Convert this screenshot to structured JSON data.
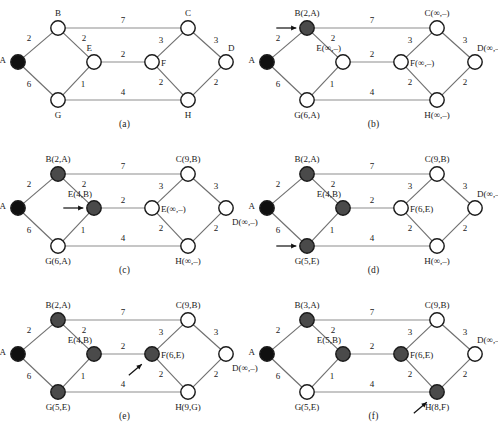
{
  "figure": {
    "caption": "",
    "panel_count": 6
  },
  "graph": {
    "weights": {
      "AB": "2",
      "AG": "6",
      "BE": "2",
      "BC": "7",
      "EF": "2",
      "EG": "1",
      "GH": "4",
      "CF": "3",
      "CD": "3",
      "FH": "2",
      "DH": "2"
    }
  },
  "panels": [
    {
      "id": "a",
      "caption": "(a)",
      "arrow": null,
      "nodes": {
        "A": {
          "label": "A",
          "state": "black",
          "label_pos": "left"
        },
        "B": {
          "label": "B",
          "state": "open",
          "label_pos": "above"
        },
        "C": {
          "label": "C",
          "state": "open",
          "label_pos": "above"
        },
        "D": {
          "label": "D",
          "state": "open",
          "label_pos": "above-right"
        },
        "E": {
          "label": "E",
          "state": "open",
          "label_pos": "above-left"
        },
        "F": {
          "label": "F",
          "state": "open",
          "label_pos": "right"
        },
        "G": {
          "label": "G",
          "state": "open",
          "label_pos": "below"
        },
        "H": {
          "label": "H",
          "state": "open",
          "label_pos": "below"
        }
      }
    },
    {
      "id": "b",
      "caption": "(b)",
      "arrow": {
        "target": "B",
        "dir": "right"
      },
      "nodes": {
        "A": {
          "label": "A",
          "state": "black",
          "label_pos": "left"
        },
        "B": {
          "label": "B(2,A)",
          "state": "filled",
          "label_pos": "above"
        },
        "C": {
          "label": "C(∞,–)",
          "state": "open",
          "label_pos": "above"
        },
        "D": {
          "label": "D(∞,–)",
          "state": "open",
          "label_pos": "above-right"
        },
        "E": {
          "label": "E(∞,–)",
          "state": "open",
          "label_pos": "above-left"
        },
        "F": {
          "label": "F(∞,–)",
          "state": "open",
          "label_pos": "right"
        },
        "G": {
          "label": "G(6,A)",
          "state": "open",
          "label_pos": "below"
        },
        "H": {
          "label": "H(∞,–)",
          "state": "open",
          "label_pos": "below"
        }
      }
    },
    {
      "id": "c",
      "caption": "(c)",
      "arrow": {
        "target": "E",
        "dir": "right"
      },
      "nodes": {
        "A": {
          "label": "A",
          "state": "black",
          "label_pos": "left"
        },
        "B": {
          "label": "B(2,A)",
          "state": "filled",
          "label_pos": "above"
        },
        "C": {
          "label": "C(9,B)",
          "state": "open",
          "label_pos": "above"
        },
        "D": {
          "label": "D(∞,–)",
          "state": "open",
          "label_pos": "below-right"
        },
        "E": {
          "label": "E(4,B)",
          "state": "filled",
          "label_pos": "above-left"
        },
        "F": {
          "label": "E(∞,–)",
          "state": "open",
          "label_pos": "right"
        },
        "G": {
          "label": "G(6,A)",
          "state": "open",
          "label_pos": "below"
        },
        "H": {
          "label": "H(∞,–)",
          "state": "open",
          "label_pos": "below"
        }
      }
    },
    {
      "id": "d",
      "caption": "(d)",
      "arrow": {
        "target": "G",
        "dir": "right"
      },
      "nodes": {
        "A": {
          "label": "A",
          "state": "black",
          "label_pos": "left"
        },
        "B": {
          "label": "B(2,A)",
          "state": "filled",
          "label_pos": "above"
        },
        "C": {
          "label": "C(9,B)",
          "state": "open",
          "label_pos": "above"
        },
        "D": {
          "label": "D(∞,–)",
          "state": "open",
          "label_pos": "above-right"
        },
        "E": {
          "label": "E(4,B)",
          "state": "filled",
          "label_pos": "above-left"
        },
        "F": {
          "label": "F(6,E)",
          "state": "open",
          "label_pos": "right"
        },
        "G": {
          "label": "G(5,E)",
          "state": "filled",
          "label_pos": "below"
        },
        "H": {
          "label": "H(∞,–)",
          "state": "open",
          "label_pos": "below"
        }
      }
    },
    {
      "id": "e",
      "caption": "(e)",
      "arrow": {
        "target": "F",
        "dir": "upright"
      },
      "nodes": {
        "A": {
          "label": "A",
          "state": "black",
          "label_pos": "left"
        },
        "B": {
          "label": "B(2,A)",
          "state": "filled",
          "label_pos": "above"
        },
        "C": {
          "label": "C(9,B)",
          "state": "open",
          "label_pos": "above"
        },
        "D": {
          "label": "D(∞,–)",
          "state": "open",
          "label_pos": "below-right"
        },
        "E": {
          "label": "E(4,B)",
          "state": "filled",
          "label_pos": "above-left"
        },
        "F": {
          "label": "F(6,E)",
          "state": "filled",
          "label_pos": "right"
        },
        "G": {
          "label": "G(5,E)",
          "state": "filled",
          "label_pos": "below"
        },
        "H": {
          "label": "H(9,G)",
          "state": "open",
          "label_pos": "below"
        }
      }
    },
    {
      "id": "f",
      "caption": "(f)",
      "arrow": {
        "target": "H",
        "dir": "upright"
      },
      "nodes": {
        "A": {
          "label": "A",
          "state": "black",
          "label_pos": "left"
        },
        "B": {
          "label": "B(3,A)",
          "state": "filled",
          "label_pos": "above"
        },
        "C": {
          "label": "C(9,B)",
          "state": "open",
          "label_pos": "above"
        },
        "D": {
          "label": "D(∞,–)",
          "state": "open",
          "label_pos": "above-right"
        },
        "E": {
          "label": "E(5,B)",
          "state": "filled",
          "label_pos": "above-left"
        },
        "F": {
          "label": "F(6,E)",
          "state": "filled",
          "label_pos": "right"
        },
        "G": {
          "label": "G(5,E)",
          "state": "open",
          "label_pos": "below"
        },
        "H": {
          "label": "H(8,F)",
          "state": "filled",
          "label_pos": "below"
        }
      }
    }
  ]
}
